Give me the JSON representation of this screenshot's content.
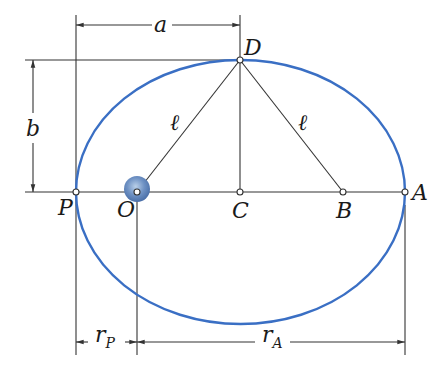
{
  "diagram": {
    "type": "elliptical-orbit-geometry",
    "orbit_color": "#3a6fc4",
    "line_color": "#333333",
    "points": {
      "P": {
        "label": "P",
        "desc": "perigee"
      },
      "O": {
        "label": "O",
        "desc": "focus (Earth)"
      },
      "C": {
        "label": "C",
        "desc": "center"
      },
      "B": {
        "label": "B",
        "desc": "empty focus"
      },
      "A": {
        "label": "A",
        "desc": "apogee"
      },
      "D": {
        "label": "D",
        "desc": "end of minor axis"
      }
    },
    "segments": {
      "OD": {
        "label": "ℓ"
      },
      "BD": {
        "label": "ℓ"
      }
    },
    "dimensions": {
      "semi_major": {
        "label": "a"
      },
      "semi_minor": {
        "label": "b"
      },
      "r_perigee": {
        "label": "r",
        "sub": "P"
      },
      "r_apogee": {
        "label": "r",
        "sub": "A"
      }
    }
  }
}
